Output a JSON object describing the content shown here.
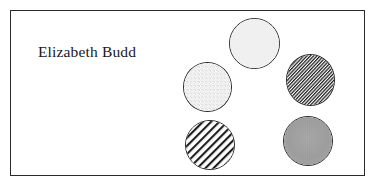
{
  "page": {
    "background_color": "#ffffff",
    "width": 376,
    "height": 188
  },
  "plate": {
    "border_color": "#2a2a2a",
    "background_color": "#ffffff"
  },
  "caption": {
    "text": "Elizabeth Budd",
    "color": "#17171c"
  },
  "discs": [
    {
      "name": "plain-disc",
      "pattern": "plain",
      "fill_color": "#f1f1f1",
      "outline_color": "#262626"
    },
    {
      "name": "stipple-disc",
      "pattern": "stipple",
      "fill_color": "#ffffff",
      "speckle_color": "#6e6e6e",
      "outline_color": "#262626"
    },
    {
      "name": "dense-hatch-disc",
      "pattern": "diagonal-hatch-dense",
      "fill_color": "#ffffff",
      "hatch_color": "#1e1e1e",
      "outline_color": "#262626"
    },
    {
      "name": "wide-hatch-disc",
      "pattern": "diagonal-hatch-wide",
      "fill_color": "#ffffff",
      "hatch_color": "#1e1e1e",
      "outline_color": "#262626"
    },
    {
      "name": "solid-gray-disc",
      "pattern": "solid",
      "fill_color": "#9d9d9d",
      "outline_color": "#262626"
    }
  ]
}
